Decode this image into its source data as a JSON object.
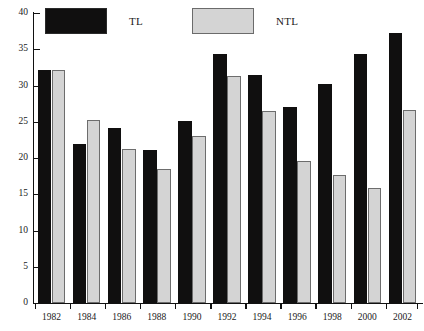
{
  "legend": {
    "entries": [
      {
        "label": "TL",
        "color": "#100f0f",
        "swatch": "black-swatch"
      },
      {
        "label": "NTL",
        "color": "#d4d4d4",
        "swatch": "gray-swatch"
      }
    ]
  },
  "axes": {
    "y_ticks": [
      "0",
      "5",
      "10",
      "15",
      "20",
      "25",
      "30",
      "35",
      "40"
    ],
    "x_ticks": [
      "1982",
      "1984",
      "1986",
      "1988",
      "1990",
      "1992",
      "1994",
      "1996",
      "1998",
      "2000",
      "2002"
    ]
  },
  "chart_data": {
    "type": "bar",
    "title": "",
    "xlabel": "",
    "ylabel": "",
    "ylim": [
      0,
      40
    ],
    "ytick_step": 5,
    "grid": false,
    "legend_position": "top",
    "categories": [
      "1982",
      "1984",
      "1986",
      "1988",
      "1990",
      "1992",
      "1994",
      "1996",
      "1998",
      "2000",
      "2002"
    ],
    "series": [
      {
        "name": "TL",
        "color": "#100f0f",
        "values": [
          32.2,
          22.0,
          24.2,
          21.1,
          25.1,
          34.3,
          31.4,
          27.0,
          30.2,
          34.4,
          37.2
        ]
      },
      {
        "name": "NTL",
        "color": "#d4d4d4",
        "values": [
          32.1,
          25.2,
          21.2,
          18.5,
          23.0,
          31.3,
          26.5,
          19.6,
          17.7,
          15.9,
          26.6
        ]
      }
    ]
  }
}
